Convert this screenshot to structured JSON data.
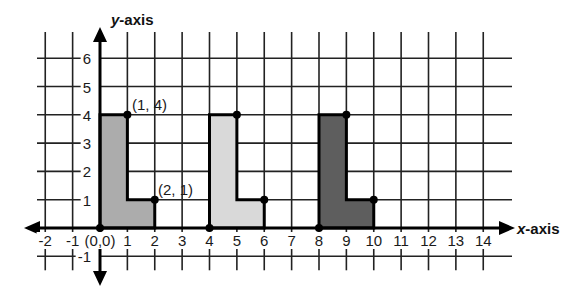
{
  "axes": {
    "x_label_italic": "x",
    "x_label_rest": "-axis",
    "y_label_italic": "y",
    "y_label_rest": "-axis",
    "x_ticks": [
      "-2",
      "-1",
      "(0,0)",
      "1",
      "2",
      "3",
      "4",
      "5",
      "6",
      "7",
      "8",
      "9",
      "10",
      "11",
      "12",
      "13",
      "14"
    ],
    "y_ticks": [
      "-1",
      "1",
      "2",
      "3",
      "4",
      "5",
      "6"
    ],
    "x_range": [
      -2,
      14
    ],
    "y_range": [
      -1,
      6
    ]
  },
  "shapes": [
    {
      "name": "original",
      "fill": "#acacac",
      "vertices": [
        [
          0,
          0
        ],
        [
          0,
          4
        ],
        [
          1,
          4
        ],
        [
          1,
          1
        ],
        [
          2,
          1
        ],
        [
          2,
          0
        ]
      ]
    },
    {
      "name": "translated-4",
      "fill": "#d9d9d9",
      "vertices": [
        [
          4,
          0
        ],
        [
          4,
          4
        ],
        [
          5,
          4
        ],
        [
          5,
          1
        ],
        [
          6,
          1
        ],
        [
          6,
          0
        ]
      ]
    },
    {
      "name": "translated-8",
      "fill": "#5e5e5e",
      "vertices": [
        [
          8,
          0
        ],
        [
          8,
          4
        ],
        [
          9,
          4
        ],
        [
          9,
          1
        ],
        [
          10,
          1
        ],
        [
          10,
          0
        ]
      ]
    }
  ],
  "point_labels": [
    {
      "text": "(1, 4)"
    },
    {
      "text": "(2, 1)"
    }
  ],
  "chart_data": {
    "type": "scatter",
    "title": "",
    "xlabel": "x-axis",
    "ylabel": "y-axis",
    "xlim": [
      -2,
      14
    ],
    "ylim": [
      -1,
      6
    ],
    "grid": true,
    "series": [
      {
        "name": "L-shape at origin",
        "x": [
          0,
          1,
          2
        ],
        "y": [
          0,
          4,
          1
        ]
      },
      {
        "name": "L-shape translated 4 right",
        "x": [
          4,
          5,
          6
        ],
        "y": [
          0,
          4,
          1
        ]
      },
      {
        "name": "L-shape translated 8 right",
        "x": [
          8,
          9,
          10
        ],
        "y": [
          0,
          4,
          1
        ]
      }
    ],
    "annotations": [
      "(1, 4)",
      "(2, 1)",
      "(0,0)"
    ]
  }
}
